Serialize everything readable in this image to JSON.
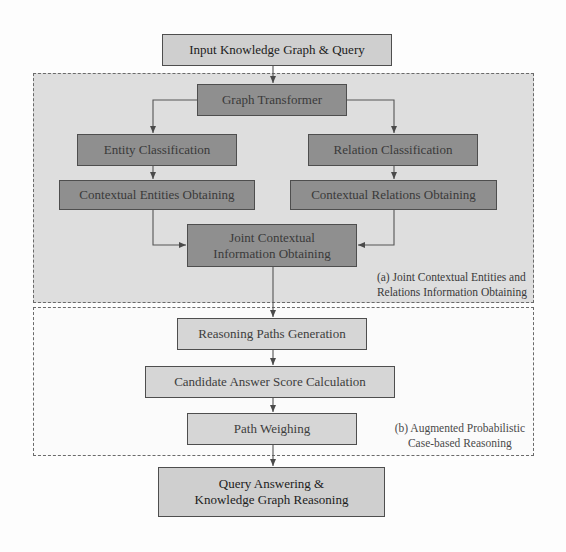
{
  "diagram": {
    "input": {
      "label": "Input Knowledge Graph & Query"
    },
    "region_a": {
      "label_line1": "(a) Joint Contextual Entities and",
      "label_line2": "Relations Information Obtaining",
      "nodes": {
        "graph_transformer": "Graph Transformer",
        "entity_classification": "Entity Classification",
        "relation_classification": "Relation Classification",
        "contextual_entities": "Contextual Entities Obtaining",
        "contextual_relations": "Contextual Relations Obtaining",
        "joint_line1": "Joint Contextual",
        "joint_line2": "Information Obtaining"
      }
    },
    "region_b": {
      "label_line1": "(b) Augmented Probabilistic",
      "label_line2": "Case-based Reasoning",
      "nodes": {
        "reasoning_paths": "Reasoning Paths Generation",
        "candidate_score": "Candidate Answer Score Calculation",
        "path_weighing": "Path Weighing"
      }
    },
    "output": {
      "label_line1": "Query Answering &",
      "label_line2": "Knowledge Graph Reasoning"
    },
    "colors": {
      "region_a_fill": "#dedede",
      "region_b_fill": "#fbfbfb",
      "dark_box": "#8f8f8f",
      "light_box": "#d6d6d6",
      "io_box": "#cfcfcf",
      "arrow": "#4a4a4a"
    }
  }
}
